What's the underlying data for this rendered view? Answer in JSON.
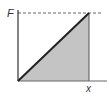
{
  "diagram": {
    "y_label": "F",
    "x_label": "x",
    "shaded_fill": "#c4c4c4",
    "line_color": "#333333"
  }
}
